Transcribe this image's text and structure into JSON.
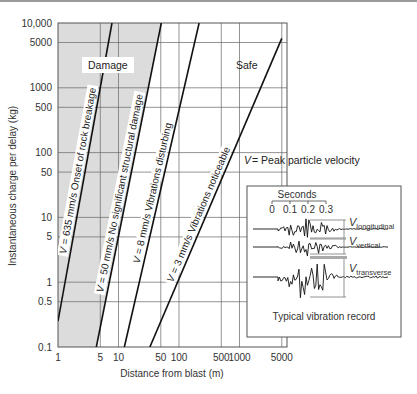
{
  "chart_data": {
    "type": "line",
    "title": "",
    "xlabel": "Distance from blast (m)",
    "ylabel": "Instantaneous charge per delay (kg)",
    "xscale": "log",
    "yscale": "log",
    "xlim": [
      1,
      5000
    ],
    "ylim": [
      0.1,
      10000
    ],
    "x_ticks": [
      "1",
      "5",
      "10",
      "50",
      "100",
      "500",
      "1000",
      "5000"
    ],
    "x_tick_values": [
      1,
      5,
      10,
      50,
      100,
      500,
      1000,
      5000
    ],
    "y_ticks": [
      "10,000",
      "5000",
      "1000",
      "500",
      "100",
      "50",
      "10",
      "5",
      "1",
      "0.5",
      "0.1"
    ],
    "y_tick_values": [
      10000,
      5000,
      1000,
      500,
      100,
      50,
      10,
      5,
      1,
      0.5,
      0.1
    ],
    "grid": true,
    "regions": [
      {
        "label": "Damage",
        "shaded": true,
        "color": "#dcdcdc"
      },
      {
        "label": "Safe",
        "shaded": false
      }
    ],
    "series": [
      {
        "name": "V = 635 mm/s",
        "description": "Onset of rock breakage",
        "label": "V = 635 mm/s   Onset of rock breakage",
        "points": [
          [
            1,
            0.25
          ],
          [
            7.8,
            10000
          ]
        ]
      },
      {
        "name": "V = 50 mm/s",
        "description": "No significant structural damage",
        "label": "V = 50 mm/s   No significant structural damage",
        "points": [
          [
            4.3,
            0.1
          ],
          [
            51,
            10000
          ]
        ]
      },
      {
        "name": "V = 8 mm/s",
        "description": "Vibrations disturbing",
        "label": "V = 8 mm/s   Vibrations disturbing",
        "points": [
          [
            12.5,
            0.1
          ],
          [
            215,
            10000
          ]
        ]
      },
      {
        "name": "V = 3 mm/s",
        "description": "Vibrations noticeable",
        "label": "V = 3 mm/s   Vibrations noticeable",
        "points": [
          [
            33,
            0.1
          ],
          [
            5000,
            5800
          ]
        ]
      }
    ],
    "annotations": [
      "V = Peak particle velocity"
    ],
    "inset": {
      "title": "Typical vibration record",
      "time_axis_label": "Seconds",
      "time_ticks": [
        "0",
        "0.1",
        "0.2",
        "0.3"
      ],
      "traces": [
        "V longitudinal",
        "V vertical",
        "V transverse"
      ]
    }
  },
  "labels": {
    "damage": "Damage",
    "safe": "Safe",
    "v_def": "= Peak particle velocity",
    "v_sym": "V",
    "inset_title": "Typical vibration record",
    "seconds": "Seconds",
    "sub_long": "longitudinal",
    "sub_vert": "vertical",
    "sub_trans": "transverse"
  }
}
